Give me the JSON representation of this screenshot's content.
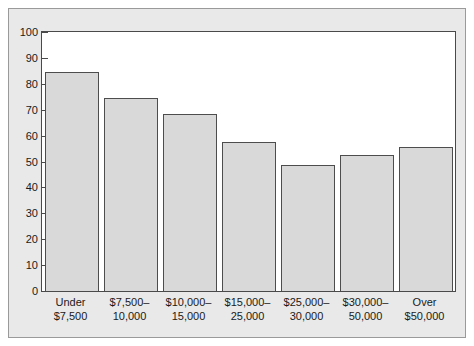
{
  "chart_data": {
    "type": "bar",
    "title": "",
    "subtitle": "",
    "xlabel": "",
    "ylabel": "",
    "ylim": [
      0,
      100
    ],
    "yticks": [
      0,
      10,
      20,
      30,
      40,
      50,
      60,
      70,
      80,
      90,
      100
    ],
    "grid": false,
    "legend": null,
    "categories": [
      "Under\n$7,500",
      "$7,500–\n10,000",
      "$10,000–\n15,000",
      "$15,000–\n25,000",
      "$25,000–\n30,000",
      "$30,000–\n50,000",
      "Over\n$50,000"
    ],
    "values": [
      84.5,
      74.5,
      68.5,
      57.5,
      48.5,
      52.5,
      55.5
    ],
    "bar_color": "#d9d9d9",
    "bar_border_color": "#4d4d4d",
    "plot_background": "#ffffff",
    "figure_background": "#e9e9e9",
    "axis_color": "#4a4a4a",
    "text_color": "#1a1a1a"
  }
}
